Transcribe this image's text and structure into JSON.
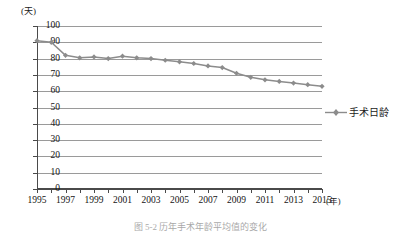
{
  "chart_data": {
    "type": "line",
    "title": "",
    "xlabel": "(年)",
    "ylabel": "(天)",
    "x": [
      1995,
      1996,
      1997,
      1998,
      1999,
      2000,
      2001,
      2002,
      2003,
      2004,
      2005,
      2006,
      2007,
      2008,
      2009,
      2010,
      2011,
      2012,
      2013,
      2014,
      2015
    ],
    "series": [
      {
        "name": "手术日龄",
        "values": [
          91,
          90,
          82,
          80.5,
          81,
          80,
          81.5,
          80.5,
          80,
          79,
          78,
          77,
          75.5,
          74.5,
          71,
          68.5,
          67,
          66,
          65,
          64,
          63
        ],
        "color": "#8c8c8c",
        "marker": "diamond"
      }
    ],
    "ylim": [
      0,
      100
    ],
    "yticks": [
      0,
      10,
      20,
      30,
      40,
      50,
      60,
      70,
      80,
      90,
      100
    ],
    "ytick_labels": [
      "0",
      "10",
      "20",
      "30",
      "40",
      "50",
      "60",
      "70",
      "80",
      "90",
      "100"
    ],
    "xlim": [
      1995,
      2015
    ],
    "xtick_labels": [
      "1995",
      "1997",
      "1999",
      "2001",
      "2003",
      "2005",
      "2007",
      "2009",
      "2011",
      "2013",
      "2015"
    ],
    "xtick_label_values": [
      1995,
      1997,
      1999,
      2001,
      2003,
      2005,
      2007,
      2009,
      2011,
      2013,
      2015
    ],
    "grid": true,
    "legend_position": "right"
  },
  "legend": {
    "label": "手术日龄"
  },
  "axes": {
    "y_unit": "(天)",
    "x_unit": "(年)"
  },
  "caption": {
    "text": "图 5-2  历年手术年龄平均值的变化"
  },
  "colors": {
    "series": "#8c8c8c",
    "grid": "#9a9a9a",
    "axis": "#4a4a4a",
    "text": "#141414"
  }
}
